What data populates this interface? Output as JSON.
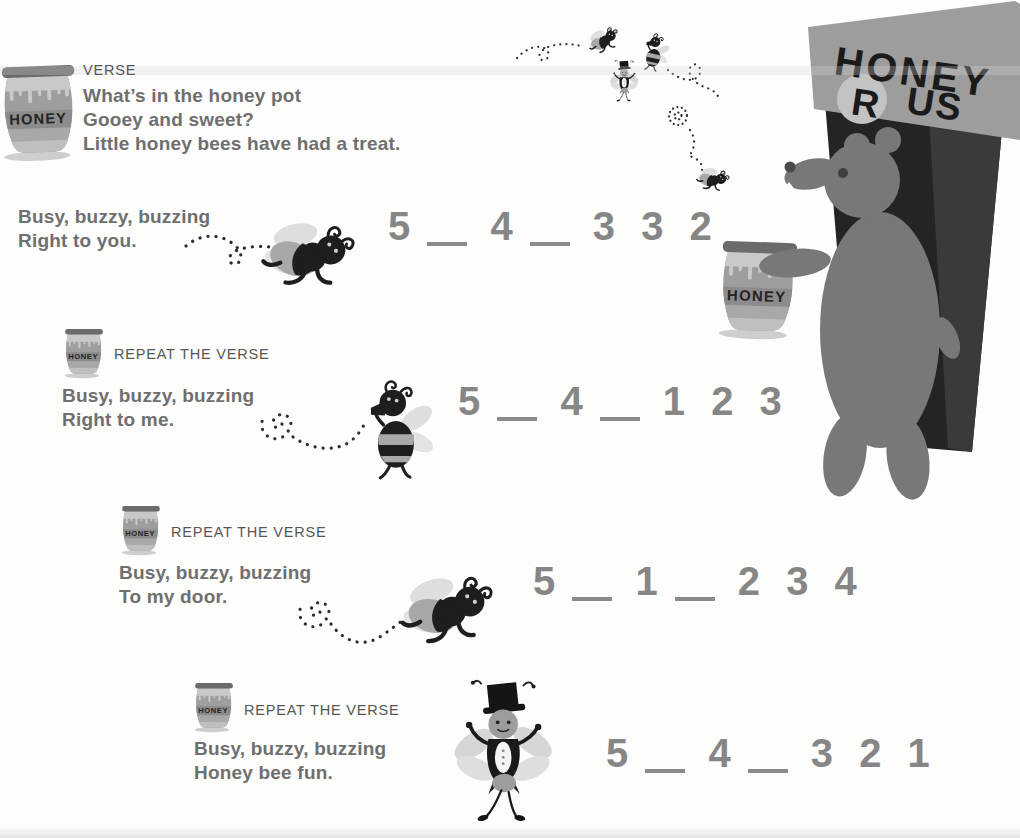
{
  "verse": {
    "label": "VERSE",
    "lines": [
      "What’s in the honey pot",
      "Gooey and sweet?",
      "Little honey bees have had a treat."
    ]
  },
  "sections": [
    {
      "label": "",
      "lyrics": [
        "Busy, buzzy, buzzing",
        "Right to you."
      ],
      "numbers": [
        {
          "value": "5",
          "hold": true
        },
        {
          "value": "4",
          "hold": true
        },
        {
          "value": "3",
          "hold": false
        },
        {
          "value": "3",
          "hold": false
        },
        {
          "value": "2",
          "hold": false
        }
      ]
    },
    {
      "label": "REPEAT THE VERSE",
      "lyrics": [
        "Busy, buzzy, buzzing",
        "Right to me."
      ],
      "numbers": [
        {
          "value": "5",
          "hold": true
        },
        {
          "value": "4",
          "hold": true
        },
        {
          "value": "1",
          "hold": false
        },
        {
          "value": "2",
          "hold": false
        },
        {
          "value": "3",
          "hold": false
        }
      ]
    },
    {
      "label": "REPEAT THE VERSE",
      "lyrics": [
        "Busy, buzzy, buzzing",
        "To my door."
      ],
      "numbers": [
        {
          "value": "5",
          "hold": true
        },
        {
          "value": "1",
          "hold": true
        },
        {
          "value": "2",
          "hold": false
        },
        {
          "value": "3",
          "hold": false
        },
        {
          "value": "4",
          "hold": false
        }
      ]
    },
    {
      "label": "REPEAT THE VERSE",
      "lyrics": [
        "Busy, buzzy, buzzing",
        "Honey bee fun."
      ],
      "numbers": [
        {
          "value": "5",
          "hold": true
        },
        {
          "value": "4",
          "hold": true
        },
        {
          "value": "3",
          "hold": false
        },
        {
          "value": "2",
          "hold": false
        },
        {
          "value": "1",
          "hold": false
        }
      ]
    }
  ],
  "sign": {
    "word1": "HONEY",
    "word2": "R",
    "word3": "US"
  },
  "pot_label": "HONEY",
  "colors": {
    "lyrics_text": "#6f6f6f",
    "label_text": "#575757",
    "numbers_text": "#868686",
    "pot_body": "#9e9e9e",
    "pot_honey": "#c9c9c9",
    "pot_band": "#8c8c8c",
    "bear": "#787878",
    "door": "#242424",
    "sign_board": "#9d9d9d",
    "sign_text": "#1b1b1b",
    "bee_black": "#1e1e1e",
    "bee_stripe": "#a8a8a8",
    "wing": "#dedede"
  }
}
